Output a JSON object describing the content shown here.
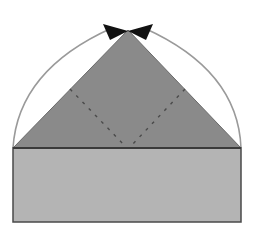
{
  "diagram": {
    "colors": {
      "background": "#ffffff",
      "rectangle_fill": "#b4b4b4",
      "triangle_fill": "#8a8a8a",
      "outline": "#4a4a4a",
      "arc": "#9a9a9a",
      "dashed": "#4a4a4a",
      "apex_marker": "#111111"
    },
    "shapes": {
      "rectangle": {
        "x": 13,
        "y": 148,
        "width": 228,
        "height": 74
      },
      "triangle": {
        "apex": [
          128,
          30
        ],
        "left": [
          13,
          148
        ],
        "right": [
          241,
          148
        ]
      },
      "dashed_lines": [
        {
          "from": [
            70,
            89
          ],
          "to": [
            127,
            148
          ]
        },
        {
          "from": [
            185,
            89
          ],
          "to": [
            127,
            148
          ]
        }
      ],
      "arcs": [
        {
          "from": [
            13,
            148
          ],
          "to": [
            128,
            30
          ],
          "side": "left"
        },
        {
          "from": [
            241,
            148
          ],
          "to": [
            128,
            30
          ],
          "side": "right"
        }
      ],
      "apex_marker": {
        "type": "bow-tie-arrowheads",
        "center": [
          128,
          31
        ]
      }
    }
  }
}
